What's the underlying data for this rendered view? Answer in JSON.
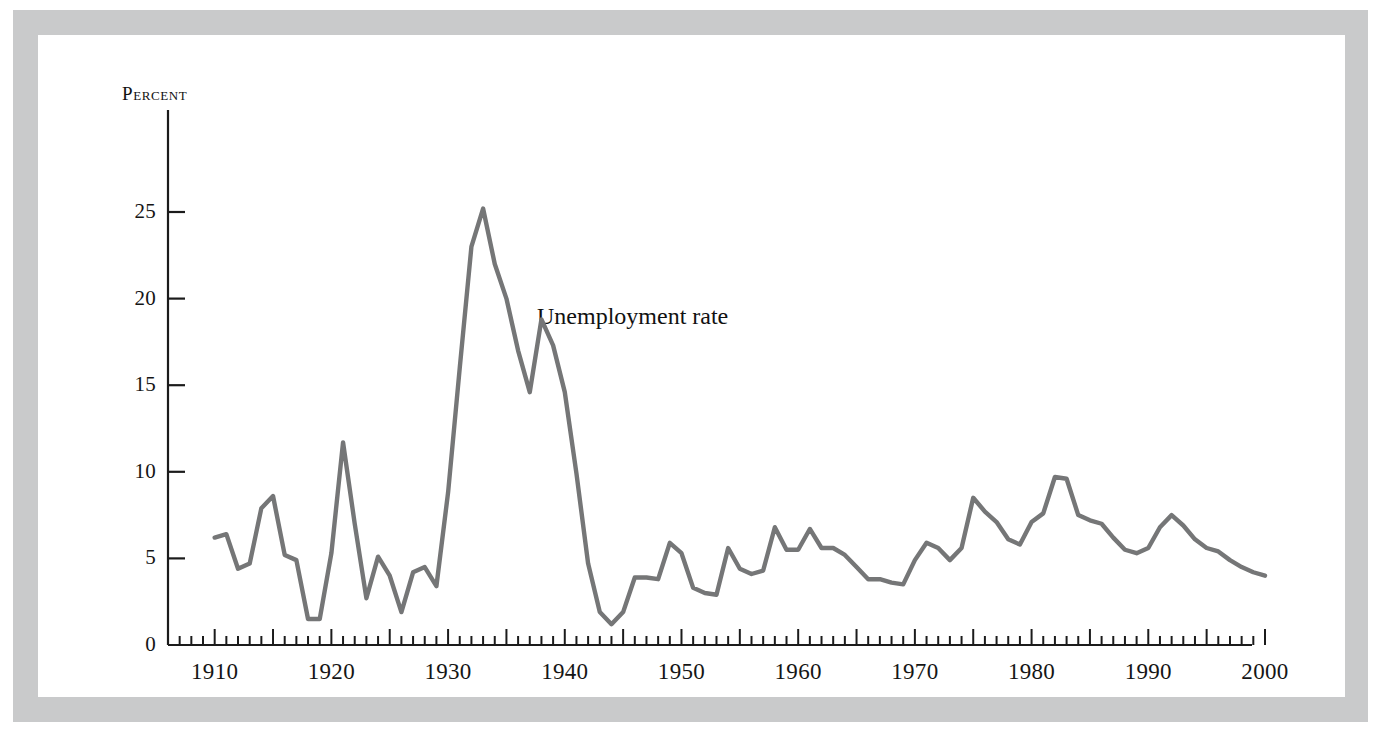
{
  "figure": {
    "y_axis_title": "Percent",
    "series_annotation": "Unemployment rate"
  },
  "chart_data": {
    "type": "line",
    "title": "",
    "subtitle": "",
    "xlabel": "",
    "ylabel": "Percent",
    "annotations": [
      "Unemployment rate"
    ],
    "grid": false,
    "legend_position": "none",
    "line_color": "#757677",
    "xlim": [
      1906,
      2000
    ],
    "ylim": [
      0,
      28
    ],
    "xticks": [
      1910,
      1920,
      1930,
      1940,
      1950,
      1960,
      1970,
      1980,
      1990,
      2000
    ],
    "xtick_labels": [
      "1910",
      "1920",
      "1930",
      "1940",
      "1950",
      "1960",
      "1970",
      "1980",
      "1990",
      "2000"
    ],
    "x_minor_tick_interval": 1,
    "x_major_tick_interval": 5,
    "yticks": [
      0,
      5,
      10,
      15,
      20,
      25
    ],
    "ytick_labels": [
      "0",
      "5",
      "10",
      "15",
      "20",
      "25"
    ],
    "series": [
      {
        "name": "Unemployment rate",
        "x": [
          1910,
          1911,
          1912,
          1913,
          1914,
          1915,
          1916,
          1917,
          1918,
          1919,
          1920,
          1921,
          1922,
          1923,
          1924,
          1925,
          1926,
          1927,
          1928,
          1929,
          1930,
          1931,
          1932,
          1933,
          1934,
          1935,
          1936,
          1937,
          1938,
          1939,
          1940,
          1941,
          1942,
          1943,
          1944,
          1945,
          1946,
          1947,
          1948,
          1949,
          1950,
          1951,
          1952,
          1953,
          1954,
          1955,
          1956,
          1957,
          1958,
          1959,
          1960,
          1961,
          1962,
          1963,
          1964,
          1965,
          1966,
          1967,
          1968,
          1969,
          1970,
          1971,
          1972,
          1973,
          1974,
          1975,
          1976,
          1977,
          1978,
          1979,
          1980,
          1981,
          1982,
          1983,
          1984,
          1985,
          1986,
          1987,
          1988,
          1989,
          1990,
          1991,
          1992,
          1993,
          1994,
          1995,
          1996,
          1997,
          1998,
          1999,
          2000
        ],
        "values": [
          6.2,
          6.4,
          4.4,
          4.7,
          7.9,
          8.6,
          5.2,
          4.9,
          1.5,
          1.5,
          5.3,
          11.7,
          7.0,
          2.7,
          5.1,
          4.0,
          1.9,
          4.2,
          4.5,
          3.4,
          8.8,
          16.0,
          23.0,
          25.2,
          22.0,
          20.0,
          17.0,
          14.6,
          18.8,
          17.3,
          14.6,
          9.9,
          4.7,
          1.9,
          1.2,
          1.9,
          3.9,
          3.9,
          3.8,
          5.9,
          5.3,
          3.3,
          3.0,
          2.9,
          5.6,
          4.4,
          4.1,
          4.3,
          6.8,
          5.5,
          5.5,
          6.7,
          5.6,
          5.6,
          5.2,
          4.5,
          3.8,
          3.8,
          3.6,
          3.5,
          4.9,
          5.9,
          5.6,
          4.9,
          5.6,
          8.5,
          7.7,
          7.1,
          6.1,
          5.8,
          7.1,
          7.6,
          9.7,
          9.6,
          7.5,
          7.2,
          7.0,
          6.2,
          5.5,
          5.3,
          5.6,
          6.8,
          7.5,
          6.9,
          6.1,
          5.6,
          5.4,
          4.9,
          4.5,
          4.2,
          4.0
        ]
      }
    ]
  }
}
